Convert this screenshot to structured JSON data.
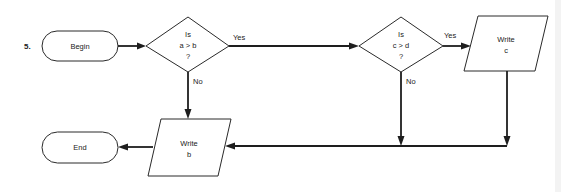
{
  "problem_number": "5.",
  "nodes": {
    "begin": {
      "type": "terminal",
      "label": "Begin"
    },
    "decision1": {
      "type": "decision",
      "lines": [
        "Is",
        "a > b",
        "?"
      ]
    },
    "decision2": {
      "type": "decision",
      "lines": [
        "Is",
        "c > d",
        "?"
      ]
    },
    "write_c": {
      "type": "output",
      "lines": [
        "Write",
        "c"
      ]
    },
    "write_b": {
      "type": "output",
      "lines": [
        "Write",
        "b"
      ]
    },
    "end": {
      "type": "terminal",
      "label": "End"
    }
  },
  "edges": {
    "d1_yes": "Yes",
    "d1_no": "No",
    "d2_yes": "Yes",
    "d2_no": "No"
  },
  "colors": {
    "stroke": "#1e1e1e",
    "background": "#ffffff"
  }
}
